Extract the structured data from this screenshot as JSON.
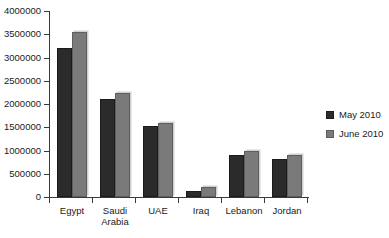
{
  "chart_data": {
    "type": "bar",
    "title": "",
    "xlabel": "",
    "ylabel": "",
    "ylim": [
      0,
      4000000
    ],
    "ytick_step": 500000,
    "grid": false,
    "legend_position": "right",
    "categories": [
      "Egypt",
      "Saudi\nArabia",
      "UAE",
      "Iraq",
      "Lebanon",
      "Jordan"
    ],
    "ytick_labels": [
      "4000000",
      "3500000",
      "3000000",
      "2500000",
      "2000000",
      "1500000",
      "1000000",
      "500000",
      "0"
    ],
    "ytick_values": [
      4000000,
      3500000,
      3000000,
      2500000,
      2000000,
      1500000,
      1000000,
      500000,
      0
    ],
    "series": [
      {
        "name": "May 2010",
        "color": "#2b2b2b",
        "values": [
          3200000,
          2100000,
          1530000,
          130000,
          900000,
          820000
        ]
      },
      {
        "name": "June 2010",
        "color": "#7a7a7a",
        "values": [
          3550000,
          2230000,
          1590000,
          210000,
          990000,
          900000
        ]
      }
    ]
  },
  "legend": {
    "items": [
      {
        "label": "May 2010",
        "swatch": "may"
      },
      {
        "label": "June 2010",
        "swatch": "june"
      }
    ]
  },
  "colors": {
    "background": "#ffffff",
    "axis": "#3a3a3a",
    "text": "#1a1a1a",
    "series_may": "#2b2b2b",
    "series_june": "#7a7a7a"
  }
}
